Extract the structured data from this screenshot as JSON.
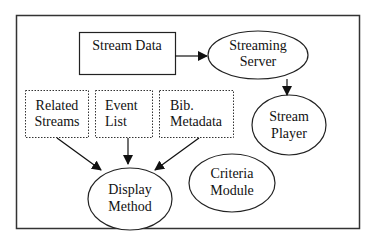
{
  "diagram": {
    "nodes": {
      "stream_data": {
        "line1": "Stream Data"
      },
      "streaming_server": {
        "line1": "Streaming",
        "line2": "Server"
      },
      "stream_player": {
        "line1": "Stream",
        "line2": "Player"
      },
      "related_streams": {
        "line1": "Related",
        "line2": "Streams"
      },
      "event_list": {
        "line1": "Event",
        "line2": "List"
      },
      "bib_metadata": {
        "line1": "Bib.",
        "line2": "Metadata"
      },
      "display_method": {
        "line1": "Display",
        "line2": "Method"
      },
      "criteria_module": {
        "line1": "Criteria",
        "line2": "Module"
      }
    },
    "edges": [
      {
        "from": "Stream Data",
        "to": "Streaming Server"
      },
      {
        "from": "Streaming Server",
        "to": "Stream Player"
      },
      {
        "from": "Related Streams",
        "to": "Display Method"
      },
      {
        "from": "Event List",
        "to": "Display Method"
      },
      {
        "from": "Bib. Metadata",
        "to": "Display Method"
      }
    ],
    "colors": {
      "stroke": "#222222",
      "background": "#ffffff"
    }
  }
}
